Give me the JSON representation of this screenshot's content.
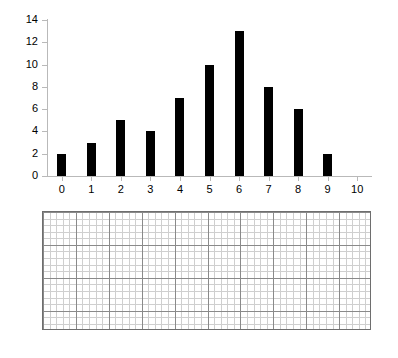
{
  "chart_data": {
    "type": "bar",
    "title": "",
    "subtitle": "",
    "xlabel": "",
    "ylabel": "",
    "categories": [
      "0",
      "1",
      "2",
      "3",
      "4",
      "5",
      "6",
      "7",
      "8",
      "9",
      "10"
    ],
    "values": [
      2,
      3,
      5,
      4,
      7,
      10,
      13,
      8,
      6,
      2,
      0
    ],
    "xtick_labels": [
      "0",
      "1",
      "2",
      "3",
      "4",
      "5",
      "6",
      "7",
      "8",
      "9",
      "10"
    ],
    "ytick_labels": [
      "0",
      "2",
      "4",
      "6",
      "8",
      "10",
      "12",
      "14"
    ],
    "ytick_values": [
      0,
      2,
      4,
      6,
      8,
      10,
      12,
      14
    ],
    "ylim": [
      0,
      14
    ],
    "xlim": [
      -0.5,
      10.5
    ],
    "grid": false,
    "legend": null,
    "bar_color": "#000000",
    "axis_color": "#b9b9b9",
    "background": "#ffffff"
  },
  "grid_paper": {
    "name": "graph-paper",
    "major_cols": 10,
    "major_rows": 4,
    "minor_per_major": 5,
    "border_color": "#6e6e6e",
    "major_line_color": "#8a8a8a",
    "minor_line_color": "#cfcfcf",
    "background": "#ffffff"
  }
}
